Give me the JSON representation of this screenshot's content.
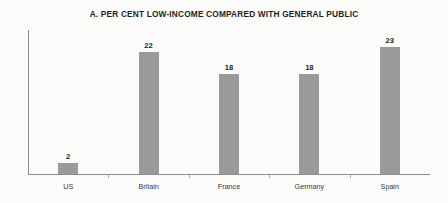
{
  "chart_data": {
    "type": "bar",
    "title": "A. PER CENT LOW-INCOME COMPARED WITH GENERAL PUBLIC",
    "xlabel": "",
    "ylabel": "",
    "categories": [
      "US",
      "Britain",
      "France",
      "Germany",
      "Spain"
    ],
    "values": [
      2,
      22,
      18,
      18,
      23
    ],
    "value_labels": [
      "2",
      "22",
      "18",
      "18",
      "23"
    ],
    "ylim": [
      0,
      26
    ],
    "grid": false,
    "legend": null,
    "bar_color": "#9a9a9a",
    "axis_color": "#8e8e8e",
    "text_color": "#231f20",
    "background_color": "#fbfbfa"
  }
}
